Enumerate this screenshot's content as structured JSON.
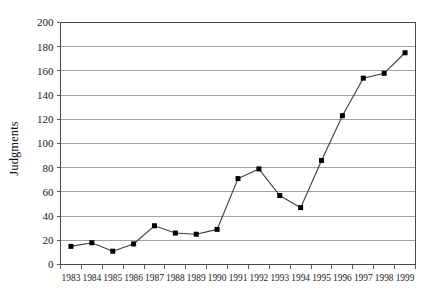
{
  "chart_data": {
    "type": "line",
    "title": "",
    "xlabel": "",
    "ylabel": "Judgments",
    "categories": [
      "1983",
      "1984",
      "1985",
      "1986",
      "1987",
      "1988",
      "1989",
      "1990",
      "1991",
      "1992",
      "1993",
      "1994",
      "1995",
      "1996",
      "1997",
      "1998",
      "1999"
    ],
    "values": [
      15,
      18,
      11,
      17,
      32,
      26,
      25,
      29,
      71,
      79,
      57,
      47,
      86,
      123,
      154,
      158,
      175
    ],
    "ylim": [
      0,
      200
    ],
    "ytick_labels": [
      "0",
      "20",
      "40",
      "60",
      "80",
      "100",
      "120",
      "140",
      "160",
      "180",
      "200"
    ],
    "ytick_values": [
      0,
      20,
      40,
      60,
      80,
      100,
      120,
      140,
      160,
      180,
      200
    ],
    "grid": true,
    "grid_axis": "y",
    "legend": false,
    "legend_position": "none",
    "marker": "square",
    "colors": {
      "line": "#3d3d3d",
      "marker": "#000000",
      "grid": "#8c8c8c",
      "axis": "#4a4a4a",
      "background": "#ffffff"
    }
  }
}
